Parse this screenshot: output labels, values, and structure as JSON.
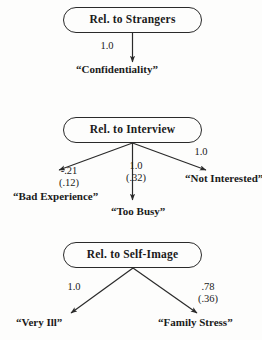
{
  "figure": {
    "type": "path-diagram",
    "panel_count": 3
  },
  "panels": [
    {
      "id": "strangers",
      "node": {
        "label": "Rel. to Strangers"
      },
      "edges": [
        {
          "id": "strangers-confidentiality",
          "coefficient": "1.0",
          "standard_error": "",
          "direction": "down",
          "target": "“Confidentiality”"
        }
      ],
      "leaves": [
        {
          "id": "confidentiality",
          "label": "“Confidentiality”"
        }
      ]
    },
    {
      "id": "interview",
      "node": {
        "label": "Rel. to Interview"
      },
      "edges": [
        {
          "id": "interview-bad-experience",
          "coefficient": "-.21",
          "standard_error": "(.12)",
          "direction": "down-left",
          "target": "“Bad Experience”"
        },
        {
          "id": "interview-too-busy",
          "coefficient": "1.0",
          "standard_error": "(.32)",
          "direction": "down",
          "target": "“Too Busy”"
        },
        {
          "id": "interview-not-interested",
          "coefficient": "1.0",
          "standard_error": "",
          "direction": "down-right",
          "target": "“Not Interested”"
        }
      ],
      "leaves": [
        {
          "id": "bad-experience",
          "label": "“Bad Experience”"
        },
        {
          "id": "too-busy",
          "label": "“Too Busy”"
        },
        {
          "id": "not-interested",
          "label": "“Not Interested”"
        }
      ]
    },
    {
      "id": "self-image",
      "node": {
        "label": "Rel. to Self-Image"
      },
      "edges": [
        {
          "id": "selfimage-very-ill",
          "coefficient": "1.0",
          "standard_error": "",
          "direction": "down-left",
          "target": "“Very Ill”"
        },
        {
          "id": "selfimage-family-stress",
          "coefficient": ".78",
          "standard_error": "(.36)",
          "direction": "down-right",
          "target": "“Family Stress”"
        }
      ],
      "leaves": [
        {
          "id": "very-ill",
          "label": "“Very Ill”"
        },
        {
          "id": "family-stress",
          "label": "“Family Stress”"
        }
      ]
    }
  ],
  "style": {
    "line_color": "#2a2a2a",
    "text_color": "#1a1a1a",
    "background": "#fdfdfc"
  }
}
